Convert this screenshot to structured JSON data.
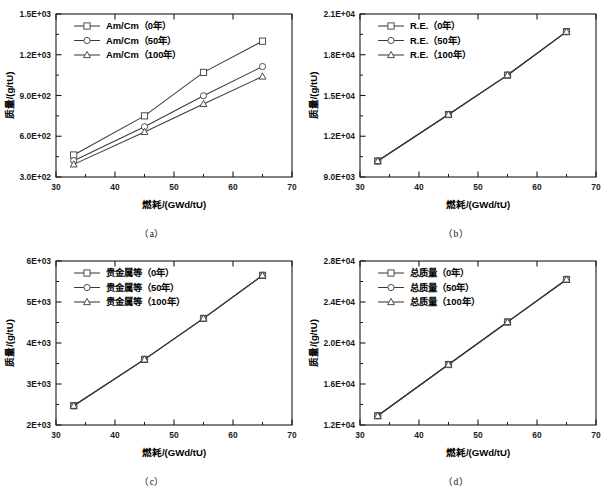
{
  "figure": {
    "panel_count": 4,
    "axis_x_title": "燃耗/(GWd/tU)",
    "axis_y_title": "质量/(g/tU)"
  },
  "captions": {
    "a": "（a）",
    "b": "（b）",
    "c": "（c）",
    "d": "（d）"
  },
  "chart_data": [
    {
      "type": "line",
      "panel": "a",
      "title": "",
      "xlabel": "燃耗/(GWd/tU)",
      "ylabel": "质量/(g/tU)",
      "xlim": [
        30,
        70
      ],
      "ylim": [
        300,
        1500
      ],
      "xticks": [
        30,
        40,
        50,
        60,
        70
      ],
      "xticklabels": [
        "30",
        "40",
        "50",
        "60",
        "70"
      ],
      "yticks": [
        300,
        600,
        900,
        1200,
        1500
      ],
      "yticklabels": [
        "3.0E+02",
        "6.0E+02",
        "9.0E+02",
        "1.2E+03",
        "1.5E+03"
      ],
      "grid": false,
      "legend_position": "upper-left",
      "x": [
        33,
        45,
        55,
        65
      ],
      "series": [
        {
          "name": "Am/Cm（0年）",
          "marker": "square",
          "values": [
            462,
            750,
            1070,
            1300
          ]
        },
        {
          "name": "Am/Cm（50年）",
          "marker": "circle",
          "values": [
            420,
            670,
            898,
            1113
          ]
        },
        {
          "name": "Am/Cm（100年）",
          "marker": "triangle",
          "values": [
            393,
            632,
            838,
            1040
          ]
        }
      ]
    },
    {
      "type": "line",
      "panel": "b",
      "title": "",
      "xlabel": "燃耗/(GWd/tU)",
      "ylabel": "质量/(g/tU)",
      "xlim": [
        30,
        70
      ],
      "ylim": [
        9000,
        21000
      ],
      "xticks": [
        30,
        40,
        50,
        60,
        70
      ],
      "xticklabels": [
        "30",
        "40",
        "50",
        "60",
        "70"
      ],
      "yticks": [
        9000,
        12000,
        15000,
        18000,
        21000
      ],
      "yticklabels": [
        "9.0E+03",
        "1.2E+04",
        "1.5E+04",
        "1.8E+04",
        "2.1E+04"
      ],
      "grid": false,
      "legend_position": "upper-left",
      "x": [
        33,
        45,
        55,
        65
      ],
      "series": [
        {
          "name": "R.E.（0年）",
          "marker": "square",
          "values": [
            10180,
            13600,
            16500,
            19700
          ]
        },
        {
          "name": "R.E.（50年）",
          "marker": "circle",
          "values": [
            10180,
            13600,
            16500,
            19700
          ]
        },
        {
          "name": "R.E.（100年）",
          "marker": "triangle",
          "values": [
            10180,
            13600,
            16500,
            19700
          ]
        }
      ]
    },
    {
      "type": "line",
      "panel": "c",
      "title": "",
      "xlabel": "燃耗/(GWd/tU)",
      "ylabel": "质量/(g/tU)",
      "xlim": [
        30,
        70
      ],
      "ylim": [
        2000,
        6000
      ],
      "xticks": [
        30,
        40,
        50,
        60,
        70
      ],
      "xticklabels": [
        "30",
        "40",
        "50",
        "60",
        "70"
      ],
      "yticks": [
        2000,
        3000,
        4000,
        5000,
        6000
      ],
      "yticklabels": [
        "2E+03",
        "3E+03",
        "4E+03",
        "5E+03",
        "6E+03"
      ],
      "grid": false,
      "legend_position": "upper-left",
      "x": [
        33,
        45,
        55,
        65
      ],
      "series": [
        {
          "name": "贵金属等（0年）",
          "marker": "square",
          "values": [
            2470,
            3600,
            4600,
            5650
          ]
        },
        {
          "name": "贵金属等（50年）",
          "marker": "circle",
          "values": [
            2470,
            3600,
            4600,
            5650
          ]
        },
        {
          "name": "贵金属等（100年）",
          "marker": "triangle",
          "values": [
            2470,
            3600,
            4600,
            5650
          ]
        }
      ]
    },
    {
      "type": "line",
      "panel": "d",
      "title": "",
      "xlabel": "燃耗/(GWd/tU)",
      "ylabel": "质量/(g/tU)",
      "xlim": [
        30,
        70
      ],
      "ylim": [
        12000,
        28000
      ],
      "xticks": [
        30,
        40,
        50,
        60,
        70
      ],
      "xticklabels": [
        "30",
        "40",
        "50",
        "60",
        "70"
      ],
      "yticks": [
        12000,
        16000,
        20000,
        24000,
        28000
      ],
      "yticklabels": [
        "1.2E+04",
        "1.6E+04",
        "2.0E+04",
        "2.4E+04",
        "2.8E+04"
      ],
      "grid": false,
      "legend_position": "upper-left",
      "x": [
        33,
        45,
        55,
        65
      ],
      "series": [
        {
          "name": "总质量（0年）",
          "marker": "square",
          "values": [
            12900,
            17900,
            22050,
            26200
          ]
        },
        {
          "name": "总质量（50年）",
          "marker": "circle",
          "values": [
            12900,
            17900,
            22050,
            26200
          ]
        },
        {
          "name": "总质量（100年）",
          "marker": "triangle",
          "values": [
            12900,
            17900,
            22050,
            26200
          ]
        }
      ]
    }
  ],
  "colors": {
    "line": "#3a3a3a",
    "axis": "#1a1a1a",
    "marker_fill": "#ffffff"
  }
}
